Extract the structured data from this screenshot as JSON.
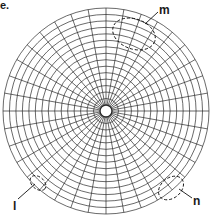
{
  "figure": {
    "panel_label": "e.",
    "center": [
      106,
      111
    ],
    "outer_radius": 103,
    "inner_radius": 6,
    "ring_count": 15,
    "spoke_count": 36,
    "line_color": "#2a2a2a",
    "labels": [
      {
        "id": "m",
        "text": "m",
        "x": 159,
        "y": 4
      },
      {
        "id": "n",
        "text": "n",
        "x": 193,
        "y": 195
      },
      {
        "id": "l",
        "text": "l",
        "x": 13,
        "y": 200
      }
    ],
    "ellipses": [
      {
        "id": "m",
        "cx": 134,
        "cy": 34,
        "rx": 22,
        "ry": 15,
        "rot": 20
      },
      {
        "id": "n",
        "cx": 171,
        "cy": 188,
        "rx": 14,
        "ry": 10,
        "rot": -40
      },
      {
        "id": "l",
        "cx": 38,
        "cy": 183,
        "rx": 9,
        "ry": 6,
        "rot": 40
      }
    ],
    "leaders": [
      {
        "id": "m",
        "x1": 158,
        "y1": 12,
        "x2": 145,
        "y2": 24
      },
      {
        "id": "n",
        "x1": 192,
        "y1": 198,
        "x2": 179,
        "y2": 189
      },
      {
        "id": "l",
        "x1": 18,
        "y1": 199,
        "x2": 35,
        "y2": 184
      }
    ]
  }
}
